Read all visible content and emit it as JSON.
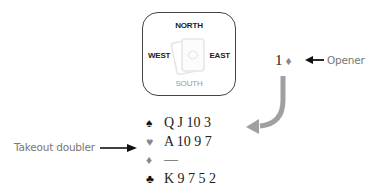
{
  "table": {
    "north": "NORTH",
    "south": "SOUTH",
    "west": "WEST",
    "east": "EAST",
    "watermark_icon": "playing-cards-icon"
  },
  "bid": {
    "level": "1",
    "suit_symbol": "♦",
    "suit": "diamonds",
    "annotation": "Opener"
  },
  "hand": {
    "annotation": "Takeout doubler",
    "suits": [
      {
        "name": "spades",
        "symbol": "♠",
        "cards": "Q J 10 3",
        "color": "#111111"
      },
      {
        "name": "hearts",
        "symbol": "♥",
        "cards": "A 10 9 7",
        "color": "#888888"
      },
      {
        "name": "diamonds",
        "symbol": "♦",
        "cards": "—",
        "color": "#888888"
      },
      {
        "name": "clubs",
        "symbol": "♣",
        "cards": "K 9 7 5 2",
        "color": "#111111"
      }
    ]
  },
  "colors": {
    "arrow_black": "#111111",
    "arrow_gray": "#a0a0a0",
    "label_gray": "#777777"
  }
}
